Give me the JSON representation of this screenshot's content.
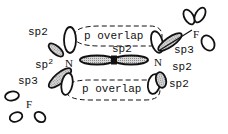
{
  "diagram": {
    "type": "orbital-hybridization",
    "colors": {
      "ink": "#111111",
      "shade": "#bdbdbd",
      "background": "#ffffff"
    },
    "atoms": {
      "n_left": "N",
      "n_right": "N",
      "f_top_right": "F",
      "f_bottom_left": "F"
    },
    "labels": {
      "top_left_sp2_a": "sp2",
      "top_left_sp2_b": "sp",
      "top_left_sp2_b_sup": "2",
      "center_sp2": "sp2",
      "overlap_top": "p overlap",
      "overlap_bottom": "p overlap",
      "right_sp3": "sp3",
      "right_sp2_a": "sp2",
      "right_sp2_b": "sp2",
      "left_sp3": "sp3"
    }
  }
}
